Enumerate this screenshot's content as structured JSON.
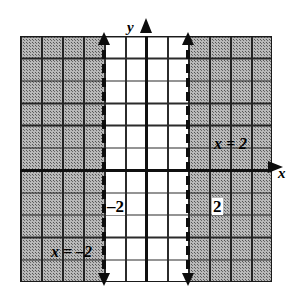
{
  "figure": {
    "background_color": "#ffffff",
    "ink_color": "#101010",
    "shade_color": "#b9b9b9"
  },
  "axes": {
    "x_label": "x",
    "y_label": "y",
    "x_arrow": "arrow-right",
    "y_arrow": "arrow-up"
  },
  "ticks": {
    "x_negative": "–2",
    "x_positive": "2"
  },
  "boundaries": [
    {
      "label": "x = –2",
      "value": -2,
      "style": "dashed",
      "arrows": "both"
    },
    {
      "label": "x = 2",
      "value": 2,
      "style": "dashed",
      "arrows": "both"
    }
  ],
  "labels": {
    "equation_positive": "x = 2",
    "equation_negative": "x = –2"
  },
  "chart_data": {
    "type": "line",
    "xlabel": "x",
    "ylabel": "y",
    "xlim": [
      -6,
      6
    ],
    "ylim": [
      -5,
      6
    ],
    "grid": true,
    "legend": "none",
    "grid_columns": 12,
    "grid_rows": 11,
    "x_ticks": [
      -2,
      2
    ],
    "x_tick_labels": [
      "–2",
      "2"
    ],
    "y_ticks": [],
    "y_tick_labels": [],
    "series": [
      {
        "name": "x = -2",
        "type": "vertical-line",
        "x": -2,
        "linestyle": "dashed",
        "arrows": "both",
        "annotation": "x = –2"
      },
      {
        "name": "x = 2",
        "type": "vertical-line",
        "x": 2,
        "linestyle": "dashed",
        "arrows": "both",
        "annotation": "x = 2"
      }
    ],
    "shaded_regions": [
      {
        "name": "left-half-plane",
        "condition": "x < -2",
        "x_range": [
          -6,
          -2
        ],
        "fill": "stipple-gray"
      },
      {
        "name": "right-half-plane",
        "condition": "x > 2",
        "x_range": [
          2,
          6
        ],
        "fill": "stipple-gray"
      }
    ],
    "annotations": [
      {
        "text": "x = 2",
        "x": 2.3,
        "y": 3.0
      },
      {
        "text": "x = –2",
        "x": -5.0,
        "y": -1.8
      },
      {
        "text": "–2",
        "x": -2.0,
        "y": -0.45
      },
      {
        "text": "2",
        "x": 2.0,
        "y": -0.45
      },
      {
        "text": "y",
        "x": 0.0,
        "y": 6.4
      },
      {
        "text": "x",
        "x": 6.4,
        "y": 0.0
      }
    ]
  }
}
